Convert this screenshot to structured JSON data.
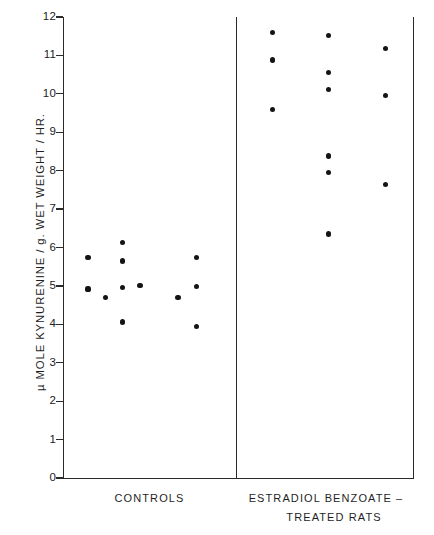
{
  "chart_data": {
    "type": "scatter",
    "title": "",
    "xlabel": "",
    "ylabel": "µ MOLE  KYNURENINE / g. WET  WEIGHT / HR.",
    "ylim": [
      0,
      12
    ],
    "yticks": [
      0,
      1,
      2,
      3,
      4,
      5,
      6,
      7,
      8,
      9,
      10,
      11,
      12
    ],
    "ytick_labels": [
      "0",
      "1",
      "2",
      "3",
      "4",
      "5",
      "6",
      "7",
      "8",
      "9",
      "10",
      "11",
      "12"
    ],
    "grid": false,
    "legend": "none",
    "axis_color": "#2b2b2b",
    "point_color": "#141414",
    "groups": [
      {
        "name": "controls",
        "label": "CONTROLS",
        "label_line2": "",
        "x_center_frac": 0.5,
        "points": [
          {
            "jitter": 0.145,
            "value": 5.75
          },
          {
            "jitter": 0.145,
            "value": 4.92
          },
          {
            "jitter": 0.245,
            "value": 4.7
          },
          {
            "jitter": 0.345,
            "value": 6.14
          },
          {
            "jitter": 0.345,
            "value": 5.65
          },
          {
            "jitter": 0.345,
            "value": 4.95
          },
          {
            "jitter": 0.345,
            "value": 4.06
          },
          {
            "jitter": 0.445,
            "value": 5.02
          },
          {
            "jitter": 0.665,
            "value": 4.7
          },
          {
            "jitter": 0.77,
            "value": 5.75
          },
          {
            "jitter": 0.77,
            "value": 4.98
          },
          {
            "jitter": 0.77,
            "value": 3.95
          }
        ]
      },
      {
        "name": "estradiol-benzoate-treated",
        "label": "ESTRADIOL   BENZOATE –",
        "label_line2": "TREATED   RATS",
        "x_center_frac": 0.5,
        "points": [
          {
            "jitter": 0.208,
            "value": 11.6
          },
          {
            "jitter": 0.208,
            "value": 10.88
          },
          {
            "jitter": 0.208,
            "value": 9.6
          },
          {
            "jitter": 0.522,
            "value": 11.52
          },
          {
            "jitter": 0.522,
            "value": 10.55
          },
          {
            "jitter": 0.522,
            "value": 10.12
          },
          {
            "jitter": 0.522,
            "value": 8.38
          },
          {
            "jitter": 0.522,
            "value": 7.95
          },
          {
            "jitter": 0.522,
            "value": 6.35
          },
          {
            "jitter": 0.845,
            "value": 11.18
          },
          {
            "jitter": 0.845,
            "value": 9.95
          },
          {
            "jitter": 0.845,
            "value": 7.65
          }
        ]
      }
    ]
  },
  "axis": {
    "y_title": "µ MOLE  KYNURENINE / g. WET  WEIGHT / HR."
  },
  "labels": {
    "controls": "CONTROLS",
    "treated_line1": "ESTRADIOL   BENZOATE –",
    "treated_line2": "TREATED   RATS"
  }
}
